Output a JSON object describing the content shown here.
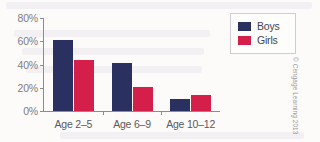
{
  "chart_data": {
    "type": "bar",
    "title": "",
    "subtitle": "",
    "xlabel": "",
    "ylabel": "",
    "categories": [
      "Age 2–5",
      "Age 6–9",
      "Age 10–12"
    ],
    "series": [
      {
        "name": "Boys",
        "color": "#2a3060",
        "values": [
          61,
          41,
          10
        ]
      },
      {
        "name": "Girls",
        "color": "#d41f4a",
        "values": [
          44,
          21,
          14
        ]
      }
    ],
    "ylim": [
      0,
      80
    ],
    "y_ticks": [
      0,
      20,
      40,
      60,
      80
    ],
    "y_tick_labels": [
      "0%",
      "20%",
      "40%",
      "60%",
      "80%"
    ],
    "grid": false,
    "legend_position": "top-right",
    "value_suffix": "%"
  },
  "legend": {
    "entries": [
      {
        "label": "Boys",
        "color": "#2a3060"
      },
      {
        "label": "Girls",
        "color": "#d41f4a"
      }
    ]
  },
  "credit": {
    "text": "© Cengage Learning 2013"
  },
  "colors": {
    "boys": "#2a3060",
    "girls": "#d41f4a",
    "axis": "#8d8b90",
    "tick_text": "#7e7c82",
    "category_text": "#5b5960",
    "background": "#fcfbf9"
  }
}
